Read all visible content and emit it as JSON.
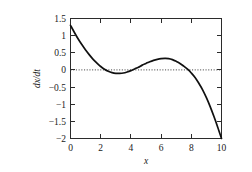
{
  "chart_data": {
    "type": "line",
    "title": "",
    "subtitle": "",
    "xlabel": "x",
    "ylabel": "dx/dt",
    "xlim": [
      0,
      10
    ],
    "ylim": [
      -2,
      1.5
    ],
    "grid": false,
    "legend": null,
    "annotations": [
      {
        "name": "zero-reference-line",
        "type": "horizontal-dotted-line",
        "y": 0
      }
    ],
    "xticks": [
      0,
      2,
      4,
      6,
      8,
      10
    ],
    "xtick_labels": [
      "0",
      "2",
      "4",
      "6",
      "8",
      "10"
    ],
    "yticks": [
      1.5,
      1,
      0.5,
      0,
      -0.5,
      -1,
      -1.5,
      -2
    ],
    "ytick_labels": [
      "1.5",
      "1",
      "0.5",
      "0",
      "−0.5",
      "−1",
      "−1.5",
      "−2"
    ],
    "series": [
      {
        "name": "dx/dt",
        "x": [
          0.0,
          0.25,
          0.5,
          0.75,
          1.0,
          1.25,
          1.5,
          1.75,
          2.0,
          2.25,
          2.5,
          2.75,
          3.0,
          3.25,
          3.5,
          3.75,
          4.0,
          4.25,
          4.5,
          4.75,
          5.0,
          5.25,
          5.5,
          5.75,
          6.0,
          6.25,
          6.5,
          6.75,
          7.0,
          7.25,
          7.5,
          7.75,
          8.0,
          8.25,
          8.5,
          8.75,
          9.0,
          9.25,
          9.5,
          9.75,
          10.0
        ],
        "y": [
          1.3,
          1.1,
          0.91,
          0.74,
          0.58,
          0.44,
          0.31,
          0.2,
          0.1,
          0.02,
          -0.04,
          -0.08,
          -0.1,
          -0.1,
          -0.09,
          -0.06,
          -0.02,
          0.03,
          0.08,
          0.14,
          0.19,
          0.24,
          0.28,
          0.31,
          0.33,
          0.335,
          0.33,
          0.3,
          0.25,
          0.19,
          0.11,
          0.02,
          -0.09,
          -0.22,
          -0.39,
          -0.58,
          -0.81,
          -1.07,
          -1.36,
          -1.67,
          -2.0
        ]
      }
    ],
    "key_points": {
      "start_value": 1.3,
      "first_zero_crossing_x": 2.2,
      "local_minimum": {
        "x": 3.1,
        "y": -0.1
      },
      "second_zero_crossing_x": 4.1,
      "local_maximum": {
        "x": 6.3,
        "y": 0.335
      },
      "third_zero_crossing_x": 8.05,
      "end_value": -2.0
    },
    "colors": {
      "curve": "#101010",
      "axis": "#2b2b2b",
      "zero_line": "#333333",
      "background": "#ffffff"
    }
  }
}
